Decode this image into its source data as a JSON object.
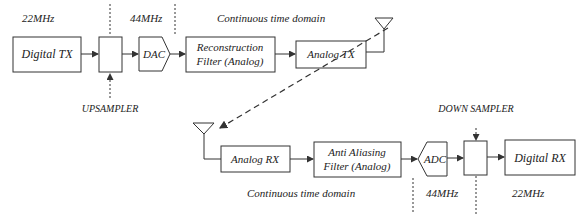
{
  "diagram": {
    "tx": {
      "digital_tx": "Digital TX",
      "dac": "DAC",
      "reconstruction_line1": "Reconstruction",
      "reconstruction_line2": "Filter (Analog)",
      "analog_tx": "Analog TX",
      "upsampler_label": "UPSAMPLER",
      "rate_22": "22MHz",
      "rate_44": "44MHz",
      "continuous_domain": "Continuous time domain"
    },
    "rx": {
      "analog_rx": "Analog RX",
      "antialias_line1": "Anti Aliasing",
      "antialias_line2": "Filter (Analog)",
      "adc": "ADC",
      "digital_rx": "Digital RX",
      "downsampler_label": "DOWN SAMPLER",
      "rate_44": "44MHz",
      "rate_22": "22MHz",
      "continuous_domain": "Continuous time domain"
    },
    "colors": {
      "stroke": "#333333",
      "text": "#222222"
    }
  }
}
